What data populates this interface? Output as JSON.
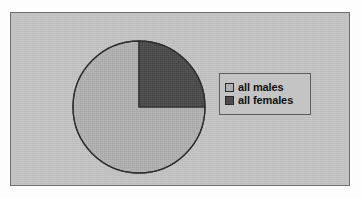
{
  "chart_data": {
    "type": "pie",
    "title": "",
    "subtitle": "",
    "xlabel": "",
    "ylabel": "",
    "grid": false,
    "legend_position": "right",
    "start_angle_deg": 0,
    "direction": "counterclockwise",
    "categories": [
      "all males",
      "all females"
    ],
    "values": [
      75,
      25
    ],
    "units": "percent",
    "slices": [
      {
        "label": "all males",
        "value": 75,
        "percent": 75,
        "color": "#b1b1b1",
        "start_angle_deg": 0,
        "end_angle_deg": 270
      },
      {
        "label": "all females",
        "value": 25,
        "percent": 25,
        "color": "#4b4b4b",
        "start_angle_deg": 270,
        "end_angle_deg": 360
      }
    ]
  },
  "legend": {
    "entries": [
      {
        "label": "all males",
        "swatch_color": "#b1b1b1"
      },
      {
        "label": "all females",
        "swatch_color": "#4b4b4b"
      }
    ]
  },
  "style": {
    "page_background": "#fdfdfd",
    "plot_background": "#c4c4c4",
    "frame_border": "#6e6e6e",
    "pie_outline": "#2b2b2b",
    "legend_border": "#5d5d5d",
    "text_color": "#111111"
  }
}
